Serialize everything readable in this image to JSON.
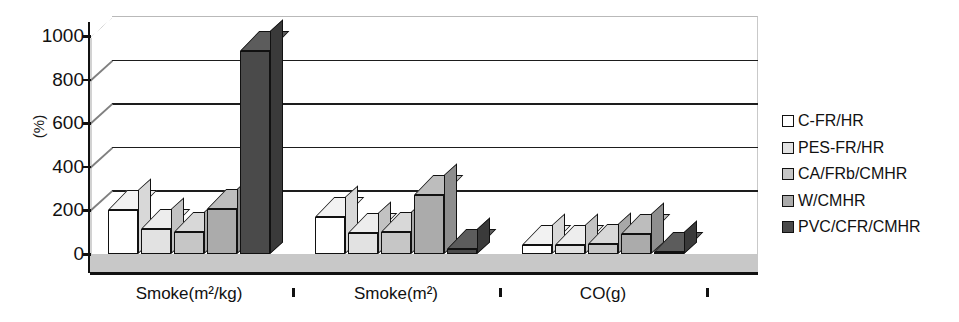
{
  "chart_data": {
    "type": "bar",
    "title": "",
    "xlabel": "",
    "ylabel": "(%)",
    "ylim": [
      0,
      1000
    ],
    "ytick_values": [
      1000,
      800,
      600,
      400,
      200,
      0
    ],
    "ytick_labels": [
      "1000",
      "800",
      "600",
      "400",
      "200",
      "0"
    ],
    "grid": true,
    "grid_axis": "y",
    "three_d": true,
    "legend_position": "right",
    "categories": [
      "Smoke(m²/kg)",
      "Smoke(m²)",
      "CO(g)"
    ],
    "series": [
      {
        "name": "C-FR/HR",
        "values": [
          200,
          170,
          40
        ],
        "color": "#ffffff"
      },
      {
        "name": "PES-FR/HR",
        "values": [
          115,
          95,
          40
        ],
        "color": "#e2e2e2"
      },
      {
        "name": "CA/FRb/CMHR",
        "values": [
          100,
          100,
          45
        ],
        "color": "#c6c6c6"
      },
      {
        "name": "W/CMHR",
        "values": [
          205,
          270,
          90
        ],
        "color": "#ababab"
      },
      {
        "name": "PVC/CFR/CMHR",
        "values": [
          930,
          25,
          5
        ],
        "color": "#4a4a4a"
      }
    ]
  },
  "legend": {
    "items": [
      {
        "label": "C-FR/HR"
      },
      {
        "label": "PES-FR/HR"
      },
      {
        "label": "CA/FRb/CMHR"
      },
      {
        "label": "W/CMHR"
      },
      {
        "label": "PVC/CFR/CMHR"
      }
    ]
  }
}
